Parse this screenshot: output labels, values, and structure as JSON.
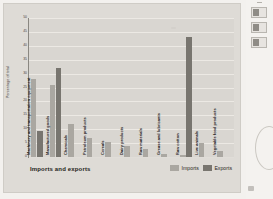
{
  "chart_data": {
    "type": "bar",
    "title": "",
    "xlabel": "Imports and exports",
    "ylabel": "Percentage of total",
    "ylim": [
      0,
      50
    ],
    "yticks": [
      0,
      5,
      10,
      15,
      20,
      25,
      30,
      35,
      40,
      45,
      50
    ],
    "grid": true,
    "legend_position": "bottom-right",
    "categories": [
      "Machinery and transportation equipment",
      "Manufactured goods",
      "Chemicals",
      "Petroleum products",
      "Cereals",
      "Dairy products",
      "Raw materials",
      "Grease and lubricants",
      "Raw cotton",
      "Live animals",
      "Vegetable food products"
    ],
    "series": [
      {
        "name": "Imports",
        "color": "#aaa7a1",
        "values": [
          28,
          26,
          12,
          7,
          5.5,
          4,
          3,
          1,
          0.6,
          5,
          2
        ]
      },
      {
        "name": "Exports",
        "color": "#78756f",
        "values": [
          9.5,
          32,
          0,
          0,
          0,
          0,
          0,
          0,
          43,
          0,
          0
        ]
      }
    ]
  },
  "axis": {
    "y_label": "Percentage of total",
    "tick_labels": [
      "0",
      "5",
      "10",
      "15",
      "20",
      "25",
      "30",
      "35",
      "40",
      "45",
      "50"
    ]
  },
  "footer": {
    "x_title": "Imports and exports"
  },
  "legend": {
    "items": [
      {
        "label": "Imports",
        "color": "#aaa7a1"
      },
      {
        "label": "Exports",
        "color": "#78756f"
      }
    ]
  },
  "side_panel": {
    "boxes": [
      {
        "name": "thumbnail-1"
      },
      {
        "name": "thumbnail-2"
      },
      {
        "name": "thumbnail-3"
      }
    ]
  }
}
